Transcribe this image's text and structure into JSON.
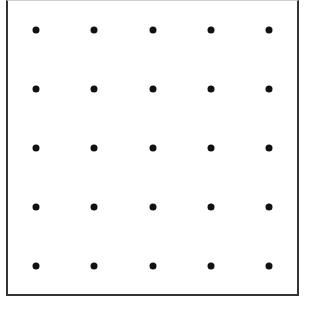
{
  "grid": {
    "rows": 5,
    "cols": 5,
    "col_x": [
      36,
      94,
      153,
      211,
      269
    ],
    "row_y": [
      30,
      89,
      148,
      207,
      266
    ],
    "dot_color": "#111111",
    "border_color": "#333333"
  }
}
